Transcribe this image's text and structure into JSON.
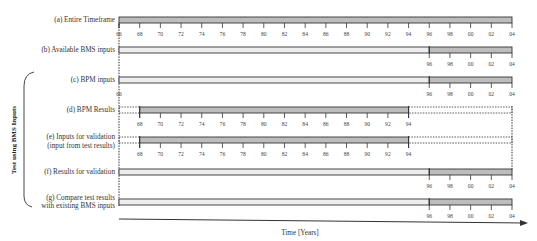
{
  "figure": {
    "side_label": "Test using BMS Inputs",
    "axis_label": "Time [Years]",
    "colors": {
      "bar_dark": "#bdbdbd",
      "bar_light": "#ededed",
      "line": "#333333"
    },
    "rows": [
      {
        "id": "a",
        "label": [
          "(a) Entire Timeframe"
        ],
        "segments": [
          {
            "from": 66,
            "to": 104,
            "fill": "dark"
          }
        ],
        "ticks": [
          "66",
          "68",
          "70",
          "72",
          "74",
          "76",
          "78",
          "80",
          "82",
          "84",
          "86",
          "88",
          "90",
          "92",
          "94",
          "96",
          "98",
          "00",
          "02",
          "04"
        ]
      },
      {
        "id": "b",
        "label": [
          "(b) Available BMS inputs"
        ],
        "segments": [
          {
            "from": 66,
            "to": 96,
            "fill": "light"
          },
          {
            "from": 96,
            "to": 104,
            "fill": "dark"
          }
        ],
        "ticks": [
          "96",
          "98",
          "00",
          "02",
          "04"
        ]
      },
      {
        "id": "c",
        "label": [
          "(c) BPM inputs"
        ],
        "segments": [
          {
            "from": 66,
            "to": 96,
            "fill": "light"
          },
          {
            "from": 96,
            "to": 104,
            "fill": "dark"
          }
        ],
        "ticks": [
          "66",
          "96",
          "98",
          "00",
          "02",
          "04"
        ]
      },
      {
        "id": "d",
        "label": [
          "(d) BPM Results"
        ],
        "segments": [
          {
            "from": 66,
            "to": 68,
            "fill": "dotted"
          },
          {
            "from": 68,
            "to": 94,
            "fill": "dark"
          },
          {
            "from": 94,
            "to": 104,
            "fill": "dotted"
          }
        ],
        "ticks": [
          "68",
          "70",
          "72",
          "74",
          "76",
          "78",
          "80",
          "82",
          "84",
          "86",
          "88",
          "90",
          "92",
          "94"
        ]
      },
      {
        "id": "e",
        "label": [
          "(e) Inputs for validation",
          "(input from test results)"
        ],
        "segments": [
          {
            "from": 66,
            "to": 68,
            "fill": "dotted"
          },
          {
            "from": 68,
            "to": 94,
            "fill": "dark"
          },
          {
            "from": 94,
            "to": 104,
            "fill": "dotted"
          }
        ],
        "ticks": [
          "68",
          "70",
          "72",
          "74",
          "76",
          "78",
          "80",
          "82",
          "84",
          "86",
          "88",
          "90",
          "92",
          "94"
        ]
      },
      {
        "id": "f",
        "label": [
          "(f) Results for validation"
        ],
        "segments": [
          {
            "from": 66,
            "to": 96,
            "fill": "light"
          },
          {
            "from": 96,
            "to": 104,
            "fill": "dark"
          }
        ],
        "ticks": [
          "96",
          "98",
          "00",
          "02",
          "04"
        ]
      },
      {
        "id": "g",
        "label": [
          "(g) Compare test results",
          "with existing BMS inputs"
        ],
        "segments": [
          {
            "from": 66,
            "to": 96,
            "fill": "light"
          },
          {
            "from": 96,
            "to": 104,
            "fill": "dark"
          }
        ],
        "ticks": [
          "96",
          "98",
          "00",
          "02",
          "04"
        ]
      }
    ]
  },
  "labels": {
    "a": "(a) Entire Timeframe",
    "b": "(b) Available BMS inputs",
    "c": "(c) BPM inputs",
    "d": "(d) BPM Results",
    "e1": "(e) Inputs for validation",
    "e2": "(input from test results)",
    "f": "(f) Results for validation",
    "g1": "(g) Compare test results",
    "g2": "with existing BMS inputs",
    "side": "Test using BMS Inputs",
    "axis": "Time [Years]"
  },
  "ticks": {
    "full": [
      "66",
      "68",
      "70",
      "72",
      "74",
      "76",
      "78",
      "80",
      "82",
      "84",
      "86",
      "88",
      "90",
      "92",
      "94",
      "96",
      "98",
      "00",
      "02",
      "04"
    ],
    "late": [
      "96",
      "98",
      "00",
      "02",
      "04"
    ],
    "mid": [
      "68",
      "70",
      "72",
      "74",
      "76",
      "78",
      "80",
      "82",
      "84",
      "86",
      "88",
      "90",
      "92",
      "94"
    ],
    "c_start": "66"
  }
}
